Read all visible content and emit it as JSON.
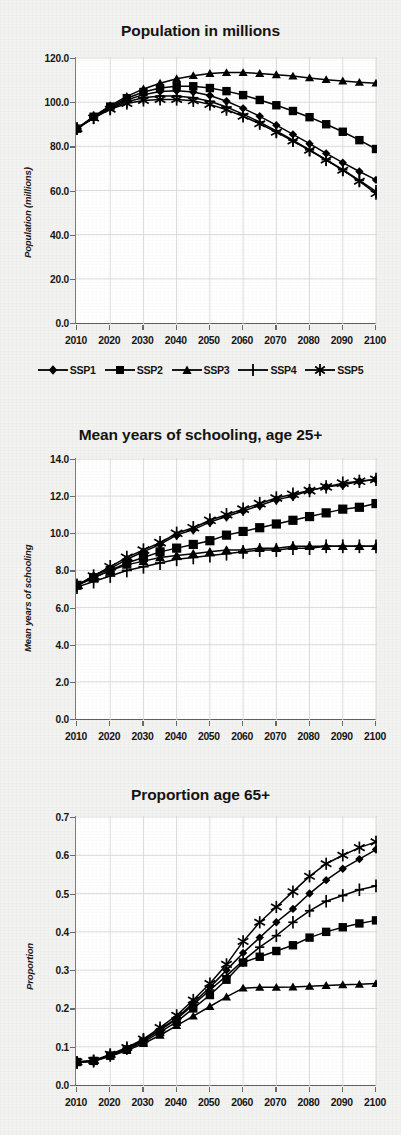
{
  "figure": {
    "background_color": "#f2f2f0",
    "plot_background_color": "#ffffff",
    "series_color": "#000000",
    "grid_color": "#d8d8d8"
  },
  "legend": {
    "position": "below-chart-1",
    "items": [
      {
        "label": "SSP1",
        "marker": "diamond-marker"
      },
      {
        "label": "SSP2",
        "marker": "square-marker"
      },
      {
        "label": "SSP3",
        "marker": "triangle-marker"
      },
      {
        "label": "SSP4",
        "marker": "plus-marker"
      },
      {
        "label": "SSP5",
        "marker": "asterisk-marker"
      }
    ]
  },
  "chart_data": [
    {
      "type": "line",
      "title": "Population in millions",
      "xlabel": "",
      "ylabel": "Population (millions)",
      "xlim": [
        2010,
        2100
      ],
      "ylim": [
        0.0,
        120.0
      ],
      "yticks": [
        "0.0",
        "20.0",
        "40.0",
        "60.0",
        "80.0",
        "100.0",
        "120.0"
      ],
      "ytick_values": [
        0,
        20,
        40,
        60,
        80,
        100,
        120
      ],
      "xticks": [
        "2010",
        "2020",
        "2030",
        "2040",
        "2050",
        "2060",
        "2070",
        "2080",
        "2090",
        "2100"
      ],
      "xtick_values": [
        2010,
        2020,
        2030,
        2040,
        2050,
        2060,
        2070,
        2080,
        2090,
        2100
      ],
      "x": [
        2010,
        2015,
        2020,
        2025,
        2030,
        2035,
        2040,
        2045,
        2050,
        2055,
        2060,
        2065,
        2070,
        2075,
        2080,
        2085,
        2090,
        2095,
        2100
      ],
      "grid": true,
      "legend_position": "bottom",
      "series": [
        {
          "name": "SSP1",
          "marker": "diamond-marker",
          "values": [
            88.0,
            93.2,
            97.6,
            101.0,
            103.4,
            104.8,
            105.2,
            104.6,
            103.0,
            100.4,
            97.2,
            93.6,
            89.6,
            85.4,
            81.2,
            76.8,
            72.6,
            68.6,
            64.8
          ]
        },
        {
          "name": "SSP2",
          "marker": "square-marker",
          "values": [
            88.0,
            93.4,
            98.0,
            101.8,
            104.6,
            106.4,
            107.2,
            107.2,
            106.4,
            105.0,
            103.2,
            101.0,
            98.6,
            96.0,
            93.2,
            90.0,
            86.6,
            82.8,
            78.8
          ]
        },
        {
          "name": "SSP3",
          "marker": "triangle-marker",
          "values": [
            88.0,
            93.6,
            98.4,
            102.6,
            106.0,
            108.6,
            110.6,
            112.0,
            113.0,
            113.4,
            113.4,
            113.0,
            112.4,
            111.8,
            111.0,
            110.2,
            109.6,
            109.0,
            108.6
          ]
        },
        {
          "name": "SSP4",
          "marker": "plus-marker",
          "values": [
            88.0,
            93.0,
            97.2,
            100.2,
            102.0,
            102.8,
            102.8,
            102.0,
            100.4,
            97.8,
            94.6,
            91.0,
            87.0,
            82.8,
            78.4,
            74.0,
            69.4,
            64.6,
            59.6
          ]
        },
        {
          "name": "SSP5",
          "marker": "asterisk-marker",
          "values": [
            88.0,
            92.8,
            96.8,
            99.4,
            100.8,
            101.2,
            101.2,
            100.6,
            99.0,
            96.6,
            93.6,
            90.2,
            86.4,
            82.4,
            78.2,
            73.8,
            69.2,
            64.2,
            58.6
          ]
        }
      ]
    },
    {
      "type": "line",
      "title": "Mean years of schooling, age 25+",
      "xlabel": "",
      "ylabel": "Mean years of schooling",
      "xlim": [
        2010,
        2100
      ],
      "ylim": [
        0.0,
        14.0
      ],
      "yticks": [
        "0.0",
        "2.0",
        "4.0",
        "6.0",
        "8.0",
        "10.0",
        "12.0",
        "14.0"
      ],
      "ytick_values": [
        0,
        2,
        4,
        6,
        8,
        10,
        12,
        14
      ],
      "xticks": [
        "2010",
        "2020",
        "2030",
        "2040",
        "2050",
        "2060",
        "2070",
        "2080",
        "2090",
        "2100"
      ],
      "xtick_values": [
        2010,
        2020,
        2030,
        2040,
        2050,
        2060,
        2070,
        2080,
        2090,
        2100
      ],
      "x": [
        2010,
        2015,
        2020,
        2025,
        2030,
        2035,
        2040,
        2045,
        2050,
        2055,
        2060,
        2065,
        2070,
        2075,
        2080,
        2085,
        2090,
        2095,
        2100
      ],
      "grid": true,
      "legend_position": "none",
      "series": [
        {
          "name": "SSP1",
          "marker": "diamond-marker",
          "values": [
            7.2,
            7.7,
            8.1,
            8.6,
            9.0,
            9.4,
            9.9,
            10.2,
            10.6,
            10.9,
            11.2,
            11.5,
            11.8,
            12.0,
            12.3,
            12.5,
            12.6,
            12.8,
            12.9
          ]
        },
        {
          "name": "SSP2",
          "marker": "square-marker",
          "values": [
            7.2,
            7.6,
            8.0,
            8.4,
            8.7,
            9.0,
            9.2,
            9.4,
            9.6,
            9.9,
            10.1,
            10.3,
            10.5,
            10.7,
            10.9,
            11.1,
            11.3,
            11.4,
            11.6
          ]
        },
        {
          "name": "SSP3",
          "marker": "triangle-marker",
          "values": [
            7.2,
            7.6,
            8.0,
            8.3,
            8.5,
            8.7,
            8.8,
            8.9,
            9.0,
            9.1,
            9.1,
            9.2,
            9.2,
            9.3,
            9.3,
            9.3,
            9.3,
            9.3,
            9.3
          ]
        },
        {
          "name": "SSP4",
          "marker": "plus-marker",
          "values": [
            7.1,
            7.4,
            7.7,
            8.0,
            8.2,
            8.4,
            8.6,
            8.7,
            8.8,
            8.9,
            9.0,
            9.1,
            9.1,
            9.2,
            9.2,
            9.3,
            9.3,
            9.3,
            9.3
          ]
        },
        {
          "name": "SSP5",
          "marker": "asterisk-marker",
          "values": [
            7.2,
            7.7,
            8.2,
            8.7,
            9.1,
            9.5,
            10.0,
            10.3,
            10.7,
            11.0,
            11.3,
            11.6,
            11.9,
            12.1,
            12.3,
            12.5,
            12.7,
            12.8,
            12.9
          ]
        }
      ]
    },
    {
      "type": "line",
      "title": "Proportion age 65+",
      "xlabel": "",
      "ylabel": "Proportion",
      "xlim": [
        2010,
        2100
      ],
      "ylim": [
        0.0,
        0.7
      ],
      "yticks": [
        "0.0",
        "0.1",
        "0.2",
        "0.3",
        "0.4",
        "0.5",
        "0.6",
        "0.7"
      ],
      "ytick_values": [
        0.0,
        0.1,
        0.2,
        0.3,
        0.4,
        0.5,
        0.6,
        0.7
      ],
      "xticks": [
        "2010",
        "2020",
        "2030",
        "2040",
        "2050",
        "2060",
        "2070",
        "2080",
        "2090",
        "2100"
      ],
      "xtick_values": [
        2010,
        2020,
        2030,
        2040,
        2050,
        2060,
        2070,
        2080,
        2090,
        2100
      ],
      "x": [
        2010,
        2015,
        2020,
        2025,
        2030,
        2035,
        2040,
        2045,
        2050,
        2055,
        2060,
        2065,
        2070,
        2075,
        2080,
        2085,
        2090,
        2095,
        2100
      ],
      "grid": true,
      "legend_position": "none",
      "series": [
        {
          "name": "SSP1",
          "marker": "diamond-marker",
          "values": [
            0.06,
            0.063,
            0.078,
            0.095,
            0.115,
            0.145,
            0.175,
            0.215,
            0.255,
            0.3,
            0.345,
            0.385,
            0.425,
            0.46,
            0.5,
            0.535,
            0.565,
            0.59,
            0.615
          ]
        },
        {
          "name": "SSP2",
          "marker": "square-marker",
          "values": [
            0.06,
            0.063,
            0.077,
            0.093,
            0.112,
            0.138,
            0.165,
            0.2,
            0.235,
            0.275,
            0.32,
            0.335,
            0.35,
            0.365,
            0.385,
            0.4,
            0.412,
            0.422,
            0.43
          ]
        },
        {
          "name": "SSP3",
          "marker": "triangle-marker",
          "values": [
            0.06,
            0.062,
            0.075,
            0.09,
            0.108,
            0.13,
            0.155,
            0.18,
            0.205,
            0.23,
            0.253,
            0.255,
            0.255,
            0.256,
            0.258,
            0.26,
            0.262,
            0.263,
            0.265
          ]
        },
        {
          "name": "SSP4",
          "marker": "plus-marker",
          "values": [
            0.058,
            0.062,
            0.077,
            0.095,
            0.117,
            0.143,
            0.172,
            0.21,
            0.248,
            0.285,
            0.325,
            0.36,
            0.39,
            0.425,
            0.455,
            0.48,
            0.495,
            0.51,
            0.52
          ]
        },
        {
          "name": "SSP5",
          "marker": "asterisk-marker",
          "values": [
            0.06,
            0.064,
            0.08,
            0.098,
            0.12,
            0.15,
            0.182,
            0.222,
            0.265,
            0.315,
            0.375,
            0.425,
            0.465,
            0.505,
            0.545,
            0.578,
            0.6,
            0.62,
            0.635
          ]
        }
      ]
    }
  ]
}
